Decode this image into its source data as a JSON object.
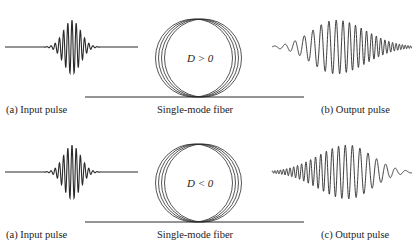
{
  "panels": [
    {
      "input_label": "(a)  Input pulse",
      "fiber_label": "Single-mode fiber",
      "dispersion_label": "D > 0",
      "output_label": "(b)  Output pulse",
      "chirp": "up"
    },
    {
      "input_label": "(a)  Input pulse",
      "fiber_label": "Single-mode fiber",
      "dispersion_label": "D < 0",
      "output_label": "(c)  Output pulse",
      "chirp": "down"
    }
  ],
  "colors": {
    "stroke": "#2a2a2a",
    "background": "#ffffff"
  }
}
